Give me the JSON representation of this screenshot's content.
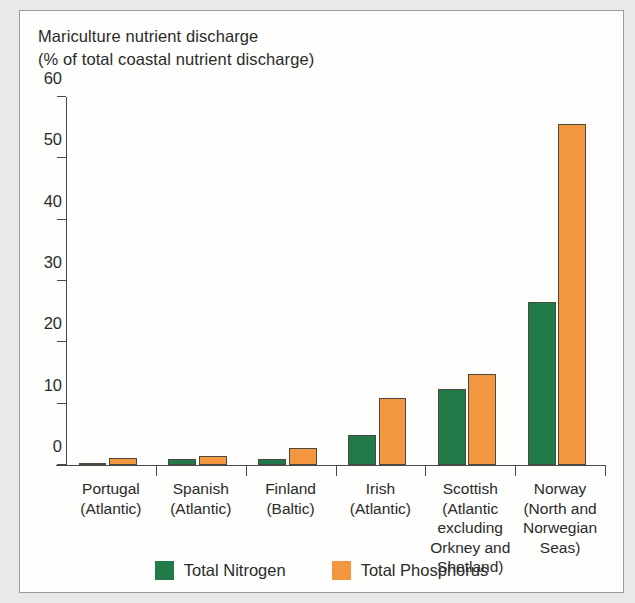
{
  "figure": {
    "title_lines": [
      "Mariculture nutrient discharge",
      "(% of total coastal nutrient discharge)"
    ]
  },
  "legend": {
    "items": [
      {
        "label": "Total Nitrogen",
        "color": "#217a47",
        "swatch": "green-square-swatch"
      },
      {
        "label": "Total Phosphorus",
        "color": "#f2973f",
        "swatch": "orange-square-swatch"
      }
    ]
  },
  "chart_data": {
    "type": "bar",
    "title": "Mariculture nutrient discharge (% of total coastal nutrient discharge)",
    "xlabel": "",
    "ylabel": "% of total coastal nutrient discharge",
    "ylim": [
      0,
      60
    ],
    "yticks": [
      0,
      10,
      20,
      30,
      40,
      50,
      60
    ],
    "ytick_labels": [
      "0",
      "10",
      "20",
      "30",
      "40",
      "50",
      "60"
    ],
    "grid": false,
    "legend_position": "bottom-center",
    "categories": [
      "Portugal\n(Atlantic)",
      "Spanish\n(Atlantic)",
      "Finland\n(Baltic)",
      "Irish\n(Atlantic)",
      "Scottish\n(Atlantic excluding Orkney and Shetland)",
      "Norway\n(North and Norwegian Seas)"
    ],
    "category_label_lines": [
      [
        "Portugal",
        "(Atlantic)"
      ],
      [
        "Spanish",
        "(Atlantic)"
      ],
      [
        "Finland",
        "(Baltic)"
      ],
      [
        "Irish",
        "(Atlantic)"
      ],
      [
        "Scottish",
        "(Atlantic",
        "excluding",
        "Orkney and",
        "Shetland)"
      ],
      [
        "Norway",
        "(North and",
        "Norwegian",
        "Seas)"
      ]
    ],
    "series": [
      {
        "name": "Total Nitrogen",
        "color": "#217a47",
        "values": [
          0.2,
          0.9,
          1.0,
          4.9,
          12.4,
          26.6
        ]
      },
      {
        "name": "Total Phosphorus",
        "color": "#f2973f",
        "values": [
          1.1,
          1.4,
          2.8,
          11.0,
          14.9,
          55.6
        ]
      }
    ]
  }
}
